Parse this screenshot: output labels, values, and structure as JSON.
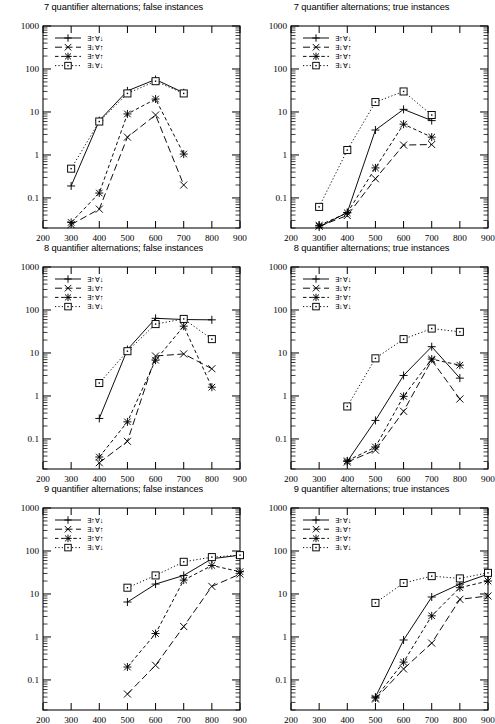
{
  "figure": {
    "panel_count": 6,
    "yaxis": {
      "scale": "log",
      "min": 0.02,
      "max": 1000,
      "ticks": [
        "1000",
        "100",
        "10",
        "1",
        "0.1"
      ],
      "tick_values": [
        1000,
        100,
        10,
        1,
        0.1
      ]
    },
    "xaxis": {
      "scale": "linear",
      "min": 200,
      "max": 900,
      "ticks": [
        "200",
        "300",
        "400",
        "500",
        "600",
        "700",
        "800",
        "900"
      ],
      "tick_values": [
        200,
        300,
        400,
        500,
        600,
        700,
        800,
        900
      ]
    },
    "legend_labels": [
      "∃↑∀↓",
      "∃↓∀↑",
      "∃↑∀↑",
      "∃↓∀↓"
    ],
    "legend_position": "top-left"
  },
  "chart_data": [
    {
      "type": "line",
      "title": "7 quantifier alternations; false instances",
      "panel": "top-left",
      "xlabel": "",
      "ylabel": "",
      "xlim": [
        200,
        900
      ],
      "ylim": [
        0.02,
        1000
      ],
      "yscale": "log",
      "grid": false,
      "legend": [
        "∃↑∀↓",
        "∃↓∀↑",
        "∃↑∀↑",
        "∃↓∀↓"
      ],
      "series": [
        {
          "name": "∃↑∀↓",
          "marker": "plus",
          "dash": "solid",
          "x": [
            300,
            400,
            500,
            600,
            700
          ],
          "values": [
            0.19,
            6.3,
            31,
            57,
            28
          ]
        },
        {
          "name": "∃↓∀↑",
          "marker": "cross",
          "dash": "longdash",
          "x": [
            300,
            400,
            500,
            600,
            700
          ],
          "values": [
            0.024,
            0.055,
            2.6,
            8.5,
            0.2
          ]
        },
        {
          "name": "∃↑∀↑",
          "marker": "star",
          "dash": "dash",
          "x": [
            300,
            400,
            500,
            600,
            700
          ],
          "values": [
            0.027,
            0.13,
            9.0,
            20,
            1.05
          ]
        },
        {
          "name": "∃↓∀↓",
          "marker": "square",
          "dash": "dot",
          "x": [
            300,
            400,
            500,
            600,
            700
          ],
          "values": [
            0.48,
            6.0,
            27,
            52,
            27
          ]
        }
      ]
    },
    {
      "type": "line",
      "title": "7 quantifier alternations; true instances",
      "panel": "top-right",
      "xlabel": "",
      "ylabel": "",
      "xlim": [
        200,
        900
      ],
      "ylim": [
        0.02,
        1000
      ],
      "yscale": "log",
      "grid": false,
      "legend": [
        "∃↑∀↓",
        "∃↓∀↑",
        "∃↑∀↑",
        "∃↓∀↓"
      ],
      "series": [
        {
          "name": "∃↑∀↓",
          "marker": "plus",
          "dash": "solid",
          "x": [
            300,
            400,
            500,
            600,
            700
          ],
          "values": [
            0.021,
            0.046,
            3.8,
            11.5,
            6.3
          ]
        },
        {
          "name": "∃↓∀↑",
          "marker": "cross",
          "dash": "longdash",
          "x": [
            300,
            400,
            500,
            600,
            700
          ],
          "values": [
            0.022,
            0.039,
            0.28,
            1.7,
            1.75
          ]
        },
        {
          "name": "∃↑∀↑",
          "marker": "star",
          "dash": "dash",
          "x": [
            300,
            400,
            500,
            600,
            700
          ],
          "values": [
            0.023,
            0.045,
            0.5,
            5.2,
            2.6
          ]
        },
        {
          "name": "∃↓∀↓",
          "marker": "square",
          "dash": "dot",
          "x": [
            300,
            400,
            500,
            600,
            700
          ],
          "values": [
            0.062,
            1.3,
            17,
            30,
            8.5
          ]
        }
      ]
    },
    {
      "type": "line",
      "title": "8 quantifier alternations; false instances",
      "panel": "middle-left",
      "xlabel": "",
      "ylabel": "",
      "xlim": [
        200,
        900
      ],
      "ylim": [
        0.02,
        1000
      ],
      "yscale": "log",
      "grid": false,
      "legend": [
        "∃↑∀↓",
        "∃↓∀↑",
        "∃↑∀↑",
        "∃↓∀↓"
      ],
      "series": [
        {
          "name": "∃↑∀↓",
          "marker": "plus",
          "dash": "solid",
          "x": [
            400,
            500,
            600,
            700,
            800
          ],
          "values": [
            0.3,
            12,
            64,
            60,
            59
          ]
        },
        {
          "name": "∃↓∀↑",
          "marker": "cross",
          "dash": "longdash",
          "x": [
            400,
            500,
            600,
            700,
            800
          ],
          "values": [
            0.028,
            0.088,
            8.5,
            9.5,
            4.3
          ]
        },
        {
          "name": "∃↑∀↑",
          "marker": "star",
          "dash": "dash",
          "x": [
            400,
            500,
            600,
            700,
            800
          ],
          "values": [
            0.038,
            0.25,
            6.8,
            42,
            1.6
          ]
        },
        {
          "name": "∃↓∀↓",
          "marker": "square",
          "dash": "dot",
          "x": [
            400,
            500,
            600,
            700,
            800
          ],
          "values": [
            2.0,
            11,
            47,
            62,
            21
          ]
        }
      ]
    },
    {
      "type": "line",
      "title": "8 quantifier alternations; true instances",
      "panel": "middle-right",
      "xlabel": "",
      "ylabel": "",
      "xlim": [
        200,
        900
      ],
      "ylim": [
        0.02,
        1000
      ],
      "yscale": "log",
      "grid": false,
      "legend": [
        "∃↑∀↓",
        "∃↓∀↑",
        "∃↑∀↑",
        "∃↓∀↓"
      ],
      "series": [
        {
          "name": "∃↑∀↓",
          "marker": "plus",
          "dash": "solid",
          "x": [
            400,
            500,
            600,
            700,
            800
          ],
          "values": [
            0.03,
            0.27,
            3.0,
            14,
            2.6
          ]
        },
        {
          "name": "∃↓∀↑",
          "marker": "cross",
          "dash": "longdash",
          "x": [
            400,
            500,
            600,
            700,
            800
          ],
          "values": [
            0.029,
            0.055,
            0.44,
            6.8,
            0.85
          ]
        },
        {
          "name": "∃↑∀↑",
          "marker": "star",
          "dash": "dash",
          "x": [
            400,
            500,
            600,
            700,
            800
          ],
          "values": [
            0.031,
            0.065,
            0.98,
            7.2,
            5.2
          ]
        },
        {
          "name": "∃↓∀↓",
          "marker": "square",
          "dash": "dot",
          "x": [
            400,
            500,
            600,
            700,
            800
          ],
          "values": [
            0.57,
            7.5,
            21,
            37,
            31
          ]
        }
      ]
    },
    {
      "type": "line",
      "title": "9 quantifier alternations; false instances",
      "panel": "bottom-left",
      "xlabel": "",
      "ylabel": "",
      "xlim": [
        200,
        900
      ],
      "ylim": [
        0.02,
        1000
      ],
      "yscale": "log",
      "grid": false,
      "legend": [
        "∃↑∀↓",
        "∃↓∀↑",
        "∃↑∀↑",
        "∃↓∀↓"
      ],
      "series": [
        {
          "name": "∃↑∀↓",
          "marker": "plus",
          "dash": "solid",
          "x": [
            500,
            600,
            700,
            800,
            900
          ],
          "values": [
            6.5,
            17,
            27,
            66,
            80
          ]
        },
        {
          "name": "∃↓∀↑",
          "marker": "cross",
          "dash": "longdash",
          "x": [
            500,
            600,
            700,
            800,
            900
          ],
          "values": [
            0.047,
            0.22,
            1.75,
            15,
            29
          ]
        },
        {
          "name": "∃↑∀↑",
          "marker": "star",
          "dash": "dash",
          "x": [
            500,
            600,
            700,
            800,
            900
          ],
          "values": [
            0.2,
            1.2,
            21,
            46,
            33
          ]
        },
        {
          "name": "∃↓∀↓",
          "marker": "square",
          "dash": "dot",
          "x": [
            500,
            600,
            700,
            800,
            900
          ],
          "values": [
            14,
            27,
            56,
            72,
            80
          ]
        }
      ]
    },
    {
      "type": "line",
      "title": "9 quantifier alternations; true instances",
      "panel": "bottom-right",
      "xlabel": "",
      "ylabel": "",
      "xlim": [
        200,
        900
      ],
      "ylim": [
        0.02,
        1000
      ],
      "yscale": "log",
      "grid": false,
      "legend": [
        "∃↑∀↓",
        "∃↓∀↑",
        "∃↑∀↑",
        "∃↓∀↓"
      ],
      "series": [
        {
          "name": "∃↑∀↓",
          "marker": "plus",
          "dash": "solid",
          "x": [
            500,
            600,
            700,
            800,
            900
          ],
          "values": [
            0.04,
            0.85,
            8.5,
            17,
            29
          ]
        },
        {
          "name": "∃↓∀↑",
          "marker": "cross",
          "dash": "longdash",
          "x": [
            500,
            600,
            700,
            800,
            900
          ],
          "values": [
            0.036,
            0.18,
            0.72,
            7.5,
            9.0
          ]
        },
        {
          "name": "∃↑∀↑",
          "marker": "star",
          "dash": "dash",
          "x": [
            500,
            600,
            700,
            800,
            900
          ],
          "values": [
            0.038,
            0.26,
            3.1,
            14,
            20
          ]
        },
        {
          "name": "∃↓∀↓",
          "marker": "square",
          "dash": "dot",
          "x": [
            500,
            600,
            700,
            800,
            900
          ],
          "values": [
            6.2,
            18,
            26,
            23,
            31
          ]
        }
      ]
    }
  ]
}
